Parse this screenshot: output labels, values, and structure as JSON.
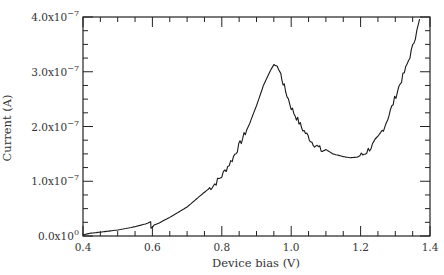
{
  "chart_data": {
    "type": "line",
    "title": "",
    "xlabel": "Device bias (V)",
    "ylabel": "Current (A)",
    "xlim": [
      0.4,
      1.4
    ],
    "ylim": [
      0,
      4e-07
    ],
    "grid": false,
    "legend": null,
    "x_ticks": [
      {
        "value": 0.4,
        "label": "0.4"
      },
      {
        "value": 0.6,
        "label": "0.6"
      },
      {
        "value": 0.8,
        "label": "0.8"
      },
      {
        "value": 1.0,
        "label": "1.0"
      },
      {
        "value": 1.2,
        "label": "1.2"
      },
      {
        "value": 1.4,
        "label": "1.4"
      }
    ],
    "y_ticks": [
      {
        "value": 0.0,
        "mantissa": "0.0x10",
        "exp": "0"
      },
      {
        "value": 1e-07,
        "mantissa": "1.0x10",
        "exp": "−7"
      },
      {
        "value": 2e-07,
        "mantissa": "2.0x10",
        "exp": "−7"
      },
      {
        "value": 3e-07,
        "mantissa": "3.0x10",
        "exp": "−7"
      },
      {
        "value": 4e-07,
        "mantissa": "4.0x10",
        "exp": "−7"
      }
    ],
    "series": [
      {
        "name": "I-V curve",
        "color": "#1a1a1a",
        "x": [
          0.4,
          0.42,
          0.45,
          0.5,
          0.55,
          0.58,
          0.595,
          0.596,
          0.6,
          0.605,
          0.62,
          0.65,
          0.7,
          0.75,
          0.78,
          0.8,
          0.83,
          0.86,
          0.88,
          0.9,
          0.92,
          0.94,
          0.95,
          0.96,
          0.97,
          0.98,
          1.0,
          1.03,
          1.06,
          1.09,
          1.1,
          1.12,
          1.15,
          1.17,
          1.19,
          1.21,
          1.23,
          1.25,
          1.27,
          1.29,
          1.31,
          1.33,
          1.35,
          1.37
        ],
        "y": [
          2e-09,
          5e-09,
          7e-09,
          1.1e-08,
          1.7e-08,
          2.2e-08,
          2.6e-08,
          1.4e-08,
          1.6e-08,
          2e-08,
          2.4e-08,
          3.4e-08,
          5.3e-08,
          8e-08,
          9.5e-08,
          1.1e-07,
          1.4e-07,
          1.78e-07,
          2.05e-07,
          2.38e-07,
          2.75e-07,
          3.02e-07,
          3.13e-07,
          3.1e-07,
          2.95e-07,
          2.72e-07,
          2.35e-07,
          1.98e-07,
          1.72e-07,
          1.55e-07,
          1.58e-07,
          1.5e-07,
          1.45e-07,
          1.43e-07,
          1.44e-07,
          1.5e-07,
          1.62e-07,
          1.78e-07,
          2.02e-07,
          2.35e-07,
          2.72e-07,
          3.05e-07,
          3.45e-07,
          3.96e-07
        ]
      }
    ]
  }
}
